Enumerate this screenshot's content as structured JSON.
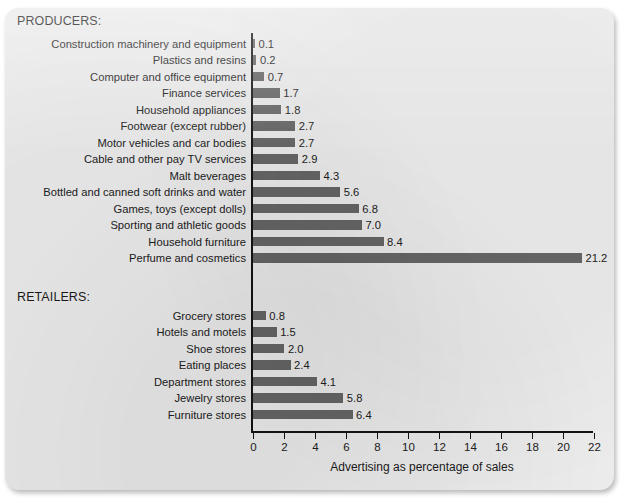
{
  "chart_data": {
    "type": "bar",
    "orientation": "horizontal",
    "title": "",
    "xlabel": "Advertising as percentage of sales",
    "ylabel": "",
    "xlim": [
      0,
      22
    ],
    "xticks": [
      0,
      2,
      4,
      6,
      8,
      10,
      12,
      14,
      16,
      18,
      20,
      22
    ],
    "xtick_labels": [
      "0",
      "2",
      "4",
      "6",
      "8",
      "10",
      "12",
      "14",
      "16",
      "18",
      "20",
      "22"
    ],
    "grid": false,
    "legend": false,
    "bar_color": "#676767",
    "groups": [
      {
        "name": "PRODUCERS:",
        "categories": [
          "Construction machinery and equipment",
          "Plastics and resins",
          "Computer and office equipment",
          "Finance services",
          "Household appliances",
          "Footwear (except rubber)",
          "Motor vehicles and car bodies",
          "Cable and other pay TV services",
          "Malt beverages",
          "Bottled and canned soft drinks and water",
          "Games, toys (except dolls)",
          "Sporting and athletic goods",
          "Household furniture",
          "Perfume and cosmetics"
        ],
        "values": [
          0.1,
          0.2,
          0.7,
          1.7,
          1.8,
          2.7,
          2.7,
          2.9,
          4.3,
          5.6,
          6.8,
          7.0,
          8.4,
          21.2
        ],
        "value_labels": [
          "0.1",
          "0.2",
          "0.7",
          "1.7",
          "1.8",
          "2.7",
          "2.7",
          "2.9",
          "4.3",
          "5.6",
          "6.8",
          "7.0",
          "8.4",
          "21.2"
        ]
      },
      {
        "name": "RETAILERS:",
        "categories": [
          "Grocery stores",
          "Hotels and motels",
          "Shoe stores",
          "Eating places",
          "Department stores",
          "Jewelry stores",
          "Furniture stores"
        ],
        "values": [
          0.8,
          1.5,
          2.0,
          2.4,
          4.1,
          5.8,
          6.4
        ],
        "value_labels": [
          "0.8",
          "1.5",
          "2.0",
          "2.4",
          "4.1",
          "5.8",
          "6.4"
        ]
      }
    ]
  }
}
